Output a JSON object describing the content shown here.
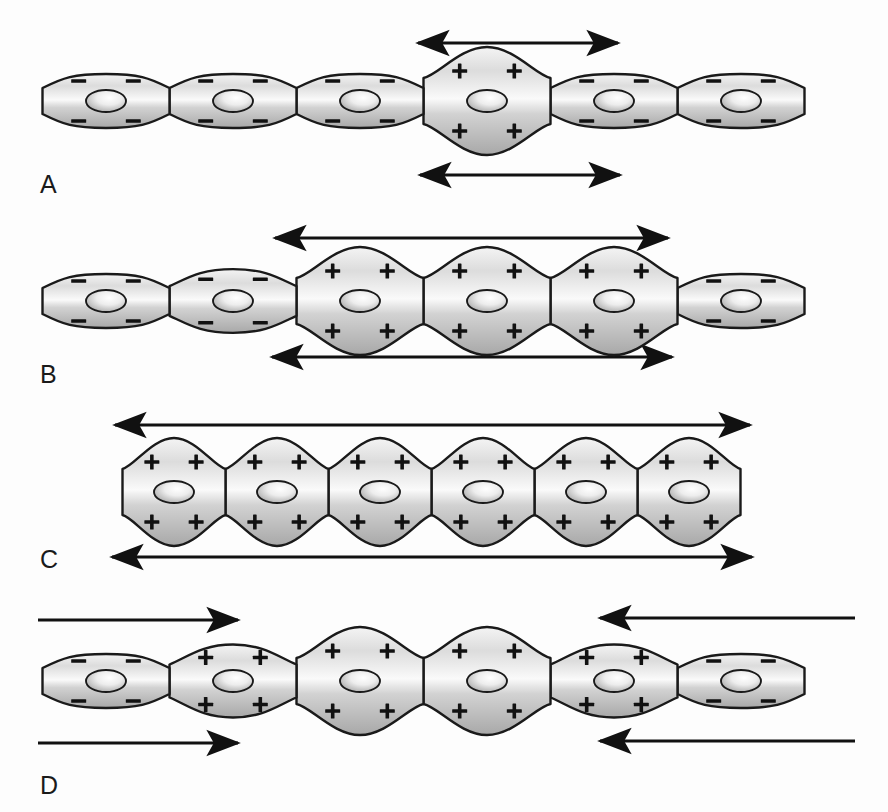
{
  "figure": {
    "background_color": "#fdfdfd",
    "cell_outline_color": "#1a1a1a",
    "cell_fill_light": "#f2f2f2",
    "cell_fill_mid": "#c9c9c9",
    "cell_fill_dark": "#9d9d9d",
    "nucleus_fill_light": "#f6f6f6",
    "nucleus_fill_dark": "#b3b3b3",
    "arrow_color": "#111111",
    "charge_positive": "+",
    "charge_negative": "–"
  },
  "panels": [
    {
      "id": "A",
      "label": "A",
      "label_x": 40,
      "label_y": 172,
      "row_y": 101,
      "cells": [
        {
          "index": 1,
          "charge": "negative",
          "swell": 0.0,
          "cx": 106,
          "width": 127
        },
        {
          "index": 2,
          "charge": "negative",
          "swell": 0.0,
          "cx": 233,
          "width": 127
        },
        {
          "index": 3,
          "charge": "negative",
          "swell": 0.0,
          "cx": 360,
          "width": 127
        },
        {
          "index": 4,
          "charge": "positive",
          "swell": 1.0,
          "cx": 487,
          "width": 127
        },
        {
          "index": 5,
          "charge": "negative",
          "swell": 0.0,
          "cx": 614,
          "width": 127
        },
        {
          "index": 6,
          "charge": "negative",
          "swell": 0.0,
          "cx": 741,
          "width": 127
        }
      ],
      "arrows": [
        {
          "position": "top",
          "x1": 418,
          "x2": 618,
          "y": 43,
          "heads": "both",
          "direction": "bidirectional"
        },
        {
          "position": "bottom",
          "x1": 420,
          "x2": 620,
          "y": 175,
          "heads": "both",
          "direction": "bidirectional"
        }
      ]
    },
    {
      "id": "B",
      "label": "B",
      "label_x": 40,
      "label_y": 362,
      "row_y": 301,
      "cells": [
        {
          "index": 1,
          "charge": "negative",
          "swell": 0.0,
          "cx": 106,
          "width": 127
        },
        {
          "index": 2,
          "charge": "negative",
          "swell": 0.18,
          "cx": 233,
          "width": 127
        },
        {
          "index": 3,
          "charge": "positive",
          "swell": 1.0,
          "cx": 360,
          "width": 127
        },
        {
          "index": 4,
          "charge": "positive",
          "swell": 1.0,
          "cx": 487,
          "width": 127
        },
        {
          "index": 5,
          "charge": "positive",
          "swell": 1.0,
          "cx": 614,
          "width": 127
        },
        {
          "index": 6,
          "charge": "negative",
          "swell": 0.0,
          "cx": 741,
          "width": 127
        }
      ],
      "arrows": [
        {
          "position": "top",
          "x1": 275,
          "x2": 668,
          "y": 238,
          "heads": "both",
          "direction": "bidirectional"
        },
        {
          "position": "bottom",
          "x1": 272,
          "x2": 672,
          "y": 357,
          "heads": "both",
          "direction": "bidirectional"
        }
      ]
    },
    {
      "id": "C",
      "label": "C",
      "label_x": 40,
      "label_y": 547,
      "row_y": 492,
      "cells": [
        {
          "index": 1,
          "charge": "positive",
          "swell": 1.0,
          "cx": 174,
          "width": 103
        },
        {
          "index": 2,
          "charge": "positive",
          "swell": 1.0,
          "cx": 277,
          "width": 103
        },
        {
          "index": 3,
          "charge": "positive",
          "swell": 1.0,
          "cx": 380,
          "width": 103
        },
        {
          "index": 4,
          "charge": "positive",
          "swell": 1.0,
          "cx": 483,
          "width": 103
        },
        {
          "index": 5,
          "charge": "positive",
          "swell": 1.0,
          "cx": 586,
          "width": 103
        },
        {
          "index": 6,
          "charge": "positive",
          "swell": 1.0,
          "cx": 689,
          "width": 103
        }
      ],
      "arrows": [
        {
          "position": "top",
          "x1": 115,
          "x2": 750,
          "y": 425,
          "heads": "both",
          "direction": "bidirectional"
        },
        {
          "position": "bottom",
          "x1": 112,
          "x2": 752,
          "y": 557,
          "heads": "both",
          "direction": "bidirectional"
        }
      ]
    },
    {
      "id": "D",
      "label": "D",
      "label_x": 40,
      "label_y": 773,
      "row_y": 681,
      "cells": [
        {
          "index": 1,
          "charge": "negative",
          "swell": 0.0,
          "cx": 106,
          "width": 127
        },
        {
          "index": 2,
          "charge": "positive",
          "swell": 0.35,
          "cx": 233,
          "width": 127
        },
        {
          "index": 3,
          "charge": "positive",
          "swell": 1.0,
          "cx": 360,
          "width": 127
        },
        {
          "index": 4,
          "charge": "positive",
          "swell": 1.0,
          "cx": 487,
          "width": 127
        },
        {
          "index": 5,
          "charge": "positive",
          "swell": 0.35,
          "cx": 614,
          "width": 127
        },
        {
          "index": 6,
          "charge": "negative",
          "swell": 0.0,
          "cx": 741,
          "width": 127
        }
      ],
      "arrows": [
        {
          "position": "top",
          "x1": 38,
          "x2": 238,
          "y": 620,
          "heads": "end",
          "direction": "rightward"
        },
        {
          "position": "top",
          "x1": 855,
          "x2": 600,
          "y": 618,
          "heads": "end",
          "direction": "leftward"
        },
        {
          "position": "bottom",
          "x1": 38,
          "x2": 238,
          "y": 743,
          "heads": "end",
          "direction": "rightward"
        },
        {
          "position": "bottom",
          "x1": 855,
          "x2": 600,
          "y": 741,
          "heads": "end",
          "direction": "leftward"
        }
      ]
    }
  ]
}
